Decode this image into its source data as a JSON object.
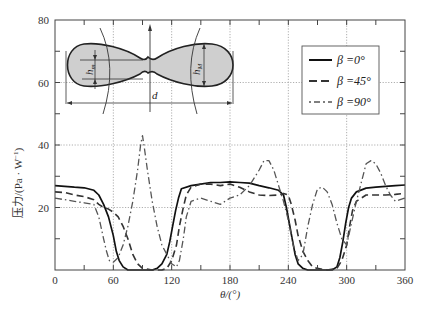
{
  "chart_data": {
    "type": "line",
    "title": "",
    "xlabel": "θ/(°)",
    "ylabel": "压力/(Pa · W⁻¹)",
    "xlim": [
      0,
      360
    ],
    "ylim": [
      0,
      80
    ],
    "xticks": [
      0,
      60,
      120,
      180,
      240,
      300,
      360
    ],
    "yticks": [
      20,
      40,
      60,
      80
    ],
    "grid": true,
    "legend_position": "upper right",
    "series": [
      {
        "name": "β =0°",
        "style": "solid",
        "x": [
          0,
          10,
          20,
          30,
          40,
          45,
          50,
          55,
          60,
          63,
          66,
          70,
          75,
          80,
          90,
          100,
          105,
          110,
          115,
          118,
          121,
          124,
          127,
          130,
          140,
          150,
          160,
          170,
          180,
          190,
          200,
          210,
          220,
          230,
          235,
          238,
          241,
          244,
          247,
          250,
          255,
          260,
          270,
          280,
          285,
          290,
          293,
          296,
          299,
          302,
          305,
          310,
          320,
          330,
          340,
          350,
          360
        ],
        "values": [
          27,
          26.8,
          26.5,
          26.3,
          25.5,
          24,
          21,
          17,
          11,
          6,
          3,
          1,
          0,
          0,
          0,
          0,
          0.5,
          2,
          5,
          9,
          14,
          19,
          23,
          26,
          27,
          27.5,
          28,
          28,
          28.2,
          28,
          27.8,
          27,
          26.3,
          25.5,
          24,
          20,
          15,
          10,
          5,
          2,
          0.5,
          0,
          0,
          0,
          0,
          1,
          4,
          9,
          15,
          20,
          23,
          25,
          26.2,
          26.5,
          26.8,
          27,
          27.2
        ]
      },
      {
        "name": "β =45°",
        "style": "dashed",
        "x": [
          0,
          10,
          20,
          30,
          40,
          45,
          50,
          55,
          60,
          65,
          70,
          75,
          80,
          85,
          90,
          100,
          110,
          115,
          120,
          125,
          128,
          132,
          135,
          140,
          150,
          160,
          170,
          180,
          190,
          200,
          210,
          220,
          230,
          235,
          240,
          243,
          247,
          250,
          255,
          260,
          265,
          270,
          280,
          290,
          295,
          300,
          303,
          306,
          310,
          320,
          330,
          340,
          350,
          360
        ],
        "values": [
          25,
          24.8,
          24,
          23.5,
          22.5,
          21,
          20,
          19.5,
          18.5,
          17,
          14,
          10,
          5,
          2,
          0.5,
          0,
          0,
          0.5,
          3,
          8,
          14,
          20,
          24,
          26.5,
          27.5,
          27.5,
          27,
          27.5,
          26.5,
          25,
          24,
          23.8,
          24,
          24.5,
          24,
          21,
          16,
          11,
          6,
          3,
          1,
          0.5,
          0,
          0.5,
          3,
          8,
          14,
          19,
          22,
          24,
          24,
          24,
          24.2,
          24.5
        ]
      },
      {
        "name": "β =90°",
        "style": "dashdot",
        "x": [
          0,
          10,
          20,
          30,
          40,
          45,
          50,
          53,
          56,
          60,
          65,
          70,
          75,
          80,
          85,
          88,
          90,
          92,
          95,
          100,
          105,
          110,
          115,
          120,
          125,
          128,
          132,
          135,
          140,
          150,
          160,
          170,
          180,
          190,
          200,
          210,
          215,
          220,
          225,
          230,
          235,
          240,
          245,
          250,
          255,
          260,
          265,
          270,
          275,
          280,
          285,
          290,
          295,
          300,
          305,
          310,
          315,
          320,
          325,
          330,
          335,
          340,
          345,
          350,
          355,
          360
        ],
        "values": [
          23,
          22.5,
          22,
          21.5,
          21,
          17,
          10,
          6,
          3,
          2.5,
          4,
          8,
          14,
          22,
          32,
          40,
          43,
          39,
          32,
          22,
          14,
          8,
          5,
          2,
          1,
          3,
          10,
          17,
          22,
          23,
          22,
          21,
          23,
          24,
          27,
          32,
          35,
          35,
          32,
          27,
          22,
          16,
          8,
          3,
          5,
          14,
          21,
          26,
          26.5,
          25,
          21,
          15,
          10,
          8,
          15,
          22,
          28,
          34,
          35,
          34,
          31,
          27,
          24,
          22,
          22.5,
          23
        ]
      }
    ],
    "legend": [
      "β =0°",
      "β =45°",
      "β =90°"
    ],
    "inset": {
      "description": "Peanut-shaped cross-section schematic",
      "labels": [
        "h_m",
        "h_M",
        "d"
      ]
    }
  },
  "axes": {
    "y_label_main": "压力/(Pa · W",
    "y_label_exp": "−1",
    "y_label_end": ")",
    "x_label": "θ/(°)",
    "x_tick_labels": [
      "0",
      "60",
      "120",
      "180",
      "240",
      "300",
      "360"
    ],
    "y_tick_labels": [
      "20",
      "40",
      "60",
      "80"
    ]
  },
  "legend": {
    "items": [
      {
        "label": "β =0°",
        "style": "solid"
      },
      {
        "label": "β =45°",
        "style": "dashed"
      },
      {
        "label": "β =90°",
        "style": "dashdot"
      }
    ]
  },
  "inset": {
    "h_m": "h",
    "h_m_sub": "m",
    "h_M": "h",
    "h_M_sub": "M",
    "d": "d"
  },
  "colors": {
    "line": "#222222",
    "grid": "#999999",
    "fill": "#cfcfcf"
  }
}
